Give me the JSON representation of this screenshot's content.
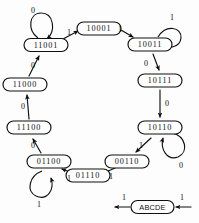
{
  "diagram": {
    "colors": {
      "ink": "#0f0f0f",
      "paper": "#fdfdfd",
      "node_fill": "#ffffff"
    },
    "states": [
      {
        "id": "s11001",
        "label": "11001",
        "x": 46,
        "y": 46
      },
      {
        "id": "s10001",
        "label": "10001",
        "x": 99,
        "y": 29
      },
      {
        "id": "s10011",
        "label": "10011",
        "x": 150,
        "y": 45
      },
      {
        "id": "s10111",
        "label": "10111",
        "x": 160,
        "y": 81
      },
      {
        "id": "s10110",
        "label": "10110",
        "x": 160,
        "y": 128
      },
      {
        "id": "s00110",
        "label": "00110",
        "x": 127,
        "y": 162
      },
      {
        "id": "s01110",
        "label": "01110",
        "x": 88,
        "y": 176
      },
      {
        "id": "s01100",
        "label": "01100",
        "x": 49,
        "y": 162
      },
      {
        "id": "s11100",
        "label": "11100",
        "x": 29,
        "y": 128
      },
      {
        "id": "s11000",
        "label": "11000",
        "x": 25,
        "y": 85
      }
    ],
    "transitions": [
      {
        "from": "s11001",
        "to": "s10001",
        "label": "1",
        "lx": 69,
        "ly": 33
      },
      {
        "from": "s10001",
        "to": "s10011",
        "label": "1",
        "lx": 120,
        "ly": 30
      },
      {
        "from": "s10011",
        "to": "s10111",
        "label": "0",
        "lx": 153,
        "ly": 64
      },
      {
        "from": "s10111",
        "to": "s10110",
        "label": "0",
        "lx": 167,
        "ly": 104
      },
      {
        "from": "s10110",
        "to": "s00110",
        "label": "1",
        "lx": 141,
        "ly": 146
      },
      {
        "from": "s00110",
        "to": "s01110",
        "label": "1",
        "lx": 110,
        "ly": 177
      },
      {
        "from": "s01110",
        "to": "s01100",
        "label": "1",
        "lx": 69,
        "ly": 177
      },
      {
        "from": "s01100",
        "to": "s11100",
        "label": "0",
        "lx": 33,
        "ly": 146
      },
      {
        "from": "s11100",
        "to": "s11000",
        "label": "0",
        "lx": 22,
        "ly": 107
      },
      {
        "from": "s11000",
        "to": "s11001",
        "label": "0",
        "lx": 32,
        "ly": 66
      }
    ],
    "self_loops": [
      {
        "state": "s11001",
        "label": "0",
        "lx": 33,
        "ly": 13,
        "position": "top"
      },
      {
        "state": "s10011",
        "label": "1",
        "lx": 170,
        "ly": 17,
        "position": "top-right"
      },
      {
        "state": "s10110",
        "label": "0",
        "lx": 181,
        "ly": 155,
        "position": "bottom-right"
      },
      {
        "state": "s01100",
        "label": "1",
        "lx": 39,
        "ly": 203,
        "position": "bottom"
      }
    ],
    "legend": {
      "name": "legend-key",
      "label": "ABCDE",
      "x": 152,
      "y": 207,
      "input_label": "1",
      "output_label": "1",
      "input_lx": 182,
      "input_ly": 198,
      "output_lx": 124,
      "output_ly": 198
    }
  }
}
